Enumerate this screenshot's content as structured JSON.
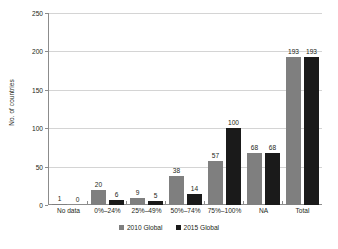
{
  "chart_data": {
    "type": "bar",
    "title": "",
    "subtitle": "",
    "xlabel": "",
    "ylabel": "No. of countries",
    "ylim": [
      0,
      250
    ],
    "ytick_labels": [
      "0",
      "50",
      "100",
      "150",
      "200",
      "250"
    ],
    "yticks": [
      0,
      50,
      100,
      150,
      200,
      250
    ],
    "grid": "horizontal",
    "legend_position": "bottom-center",
    "categories": [
      "No data",
      "0%–24%",
      "25%–49%",
      "50%–74%",
      "75%–100%",
      "NA",
      "Total"
    ],
    "series": [
      {
        "name": "2010 Global",
        "color": "#7f7f7f",
        "values": [
          1,
          20,
          9,
          38,
          57,
          68,
          193
        ],
        "labels": [
          "1",
          "20",
          "9",
          "38",
          "57",
          "68",
          "193"
        ]
      },
      {
        "name": "2015 Global",
        "color": "#1a1a1a",
        "values": [
          0,
          6,
          5,
          14,
          100,
          68,
          193
        ],
        "labels": [
          "0",
          "6",
          "5",
          "14",
          "100",
          "68",
          "193"
        ]
      }
    ]
  },
  "axis": {
    "y_title": "No. of countries"
  },
  "colors": {
    "series_2010": "#7f7f7f",
    "series_2015": "#1a1a1a",
    "gridline": "#d4d4d4",
    "axis": "#8c8c8c",
    "text": "#231f20",
    "background": "#ffffff"
  }
}
